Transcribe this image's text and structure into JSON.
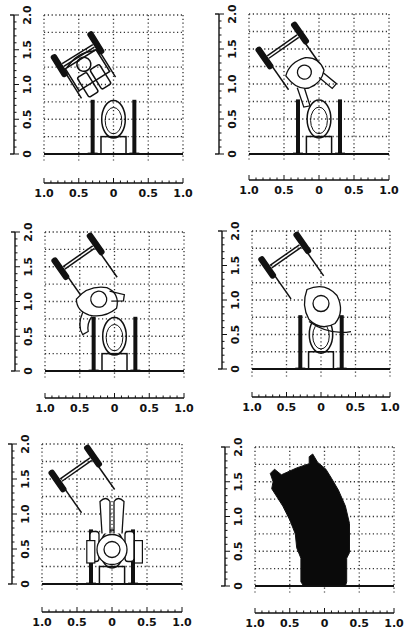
{
  "figure": {
    "colors": {
      "ink": "#111111",
      "grid": "#333333",
      "background": "#ffffff",
      "fill_area": "#0a0a0a"
    },
    "axes": {
      "x_ticks": [
        "1.0",
        "0.5",
        "0",
        "0.5",
        "1.0"
      ],
      "y_ticks": [
        "0",
        "0.5",
        "1.0",
        "1.5",
        "2.0"
      ],
      "x_range": [
        -1.0,
        1.0
      ],
      "y_range": [
        0,
        2.0
      ],
      "grid_step": 0.25,
      "grid_style": "dotted"
    },
    "panels": [
      {
        "id": 1,
        "position": "top-left",
        "stage": "approach - wheelchair angled, occupant seated"
      },
      {
        "id": 2,
        "position": "top-right",
        "stage": "occupant leaning forward out of wheelchair"
      },
      {
        "id": 3,
        "position": "middle-left",
        "stage": "occupant rising, hands reaching toward left grab bar"
      },
      {
        "id": 4,
        "position": "middle-right",
        "stage": "occupant pivoting over toilet bowl"
      },
      {
        "id": 5,
        "position": "bottom-left",
        "stage": "occupant seated on toilet, holding both grab bars"
      },
      {
        "id": 6,
        "position": "bottom-right",
        "stage": "composite swept area (filled silhouette)"
      }
    ],
    "fixtures": {
      "toilet_bowl": "oval, centered at x=0, y≈0.25-0.75",
      "cistern": "rectangle, x≈-0.18..0.18, y≈0..0.25",
      "grab_bars": "vertical bars at x≈-0.30 and x≈+0.30, y 0..0.78",
      "floor_line": "y=0 from x=-1 to 1"
    }
  }
}
